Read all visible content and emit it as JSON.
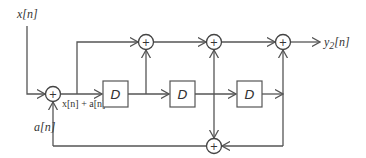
{
  "diagram": {
    "input_label": "x[n]",
    "output_label": "y",
    "output_subscript": "2",
    "output_suffix": "[n]",
    "feedback_label": "a[n]",
    "sum_label": "x[n] + a[n]",
    "delay_label": "D",
    "adder_symbol": "+",
    "colors": {
      "line": "#555555",
      "text": "#333333",
      "background": "#ffffff"
    },
    "delays": [
      {
        "id": "D1",
        "label": "D"
      },
      {
        "id": "D2",
        "label": "D"
      },
      {
        "id": "D3",
        "label": "D"
      }
    ],
    "adders": [
      {
        "id": "input-adder",
        "symbol": "+"
      },
      {
        "id": "top-adder-1",
        "symbol": "+"
      },
      {
        "id": "top-adder-2",
        "symbol": "+"
      },
      {
        "id": "top-adder-3",
        "symbol": "+"
      },
      {
        "id": "bottom-adder",
        "symbol": "+"
      }
    ]
  }
}
